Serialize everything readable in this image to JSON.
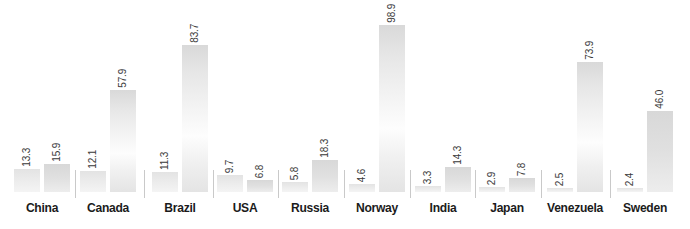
{
  "chart_data": {
    "type": "bar",
    "title": "",
    "xlabel": "",
    "ylabel": "",
    "grid": false,
    "legend_position": "none",
    "ylim": [
      0,
      98.9
    ],
    "categories": [
      "China",
      "Canada",
      "Brazil",
      "USA",
      "Russia",
      "Norway",
      "India",
      "Japan",
      "Venezuela",
      "Sweden"
    ],
    "series": [
      {
        "name": "series-1",
        "color": "#e8e8e8",
        "values": [
          13.3,
          12.1,
          11.3,
          9.7,
          5.8,
          4.6,
          3.3,
          2.9,
          2.5,
          2.4
        ]
      },
      {
        "name": "series-2",
        "color": "#dcdcdc",
        "values": [
          15.9,
          57.9,
          83.7,
          6.8,
          18.3,
          98.9,
          14.3,
          7.8,
          73.9,
          46.0
        ]
      }
    ],
    "value_labels": [
      [
        "13.3",
        "15.9"
      ],
      [
        "12.1",
        "57.9"
      ],
      [
        "11.3",
        "83.7"
      ],
      [
        "9.7",
        "6.8"
      ],
      [
        "5.8",
        "18.3"
      ],
      [
        "4.6",
        "98.9"
      ],
      [
        "3.3",
        "14.3"
      ],
      [
        "2.9",
        "7.8"
      ],
      [
        "2.5",
        "73.9"
      ],
      [
        "2.4",
        "46.0"
      ]
    ]
  },
  "colors": {
    "bar_series_1": "#e8e8e8",
    "bar_series_2": "#dcdcdc",
    "divider": "#c9c9c9",
    "label_text": "#1b1b1b",
    "value_text": "#3a3a3a",
    "background": "#ffffff"
  }
}
